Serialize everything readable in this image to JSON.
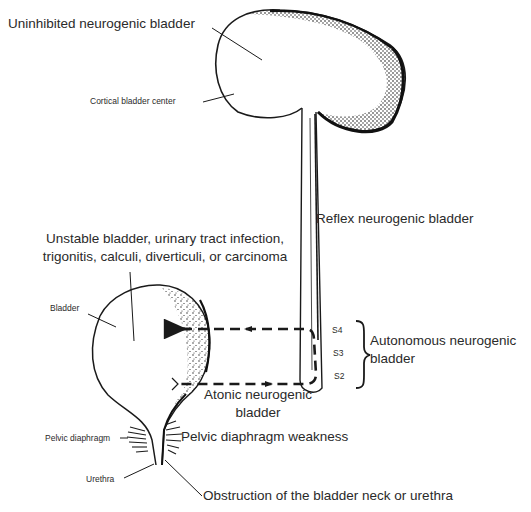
{
  "diagram": {
    "type": "anatomical-illustration",
    "colors": {
      "ink": "#1a1a1a",
      "text": "#2a2a2a",
      "background": "#ffffff"
    }
  },
  "labels": {
    "uninhibited": "Uninhibited neurogenic bladder",
    "cortical_center": "Cortical bladder center",
    "reflex": "Reflex neurogenic bladder",
    "unstable_line1": "Unstable bladder, urinary tract infection,",
    "unstable_line2": "trigonitis, calculi, diverticuli, or carcinoma",
    "bladder": "Bladder",
    "s4": "S4",
    "s3": "S3",
    "s2": "S2",
    "autonomous_line1": "Autonomous neurogenic",
    "autonomous_line2": "bladder",
    "atonic_line1": "Atonic neurogenic",
    "atonic_line2": "bladder",
    "pelvic_diaphragm": "Pelvic diaphragm",
    "pelvic_weakness": "Pelvic diaphragm weakness",
    "urethra": "Urethra",
    "obstruction": "Obstruction of the bladder neck or urethra"
  }
}
